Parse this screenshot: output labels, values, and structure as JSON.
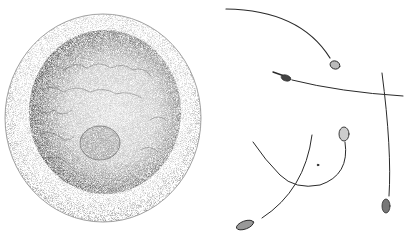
{
  "illustration": {
    "subject": "Stippled illustration of an egg cell and spermatozoa",
    "egg": {
      "label": "egg cell"
    },
    "sperm_count": 5,
    "colors": {
      "background": "#ffffff",
      "ink": "#1a1a1a",
      "shell": "#9a9a9a",
      "interior": "#6a6a6a"
    }
  }
}
